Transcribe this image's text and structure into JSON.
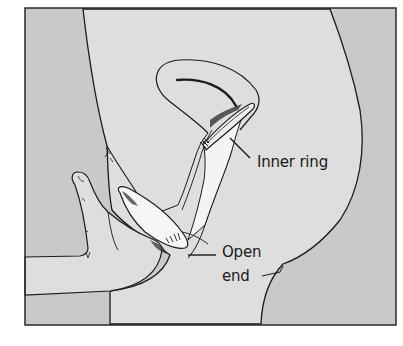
{
  "figure": {
    "labels": {
      "inner_ring": "Inner ring",
      "open_end_line1": "Open",
      "open_end_line2": "end"
    },
    "colors": {
      "background_outer": "#c9c9c9",
      "body": "#dedede",
      "condom": "#f2f2f2",
      "stroke": "#1a1a1a",
      "frame": "#2a2a2a",
      "page": "#ffffff"
    }
  }
}
